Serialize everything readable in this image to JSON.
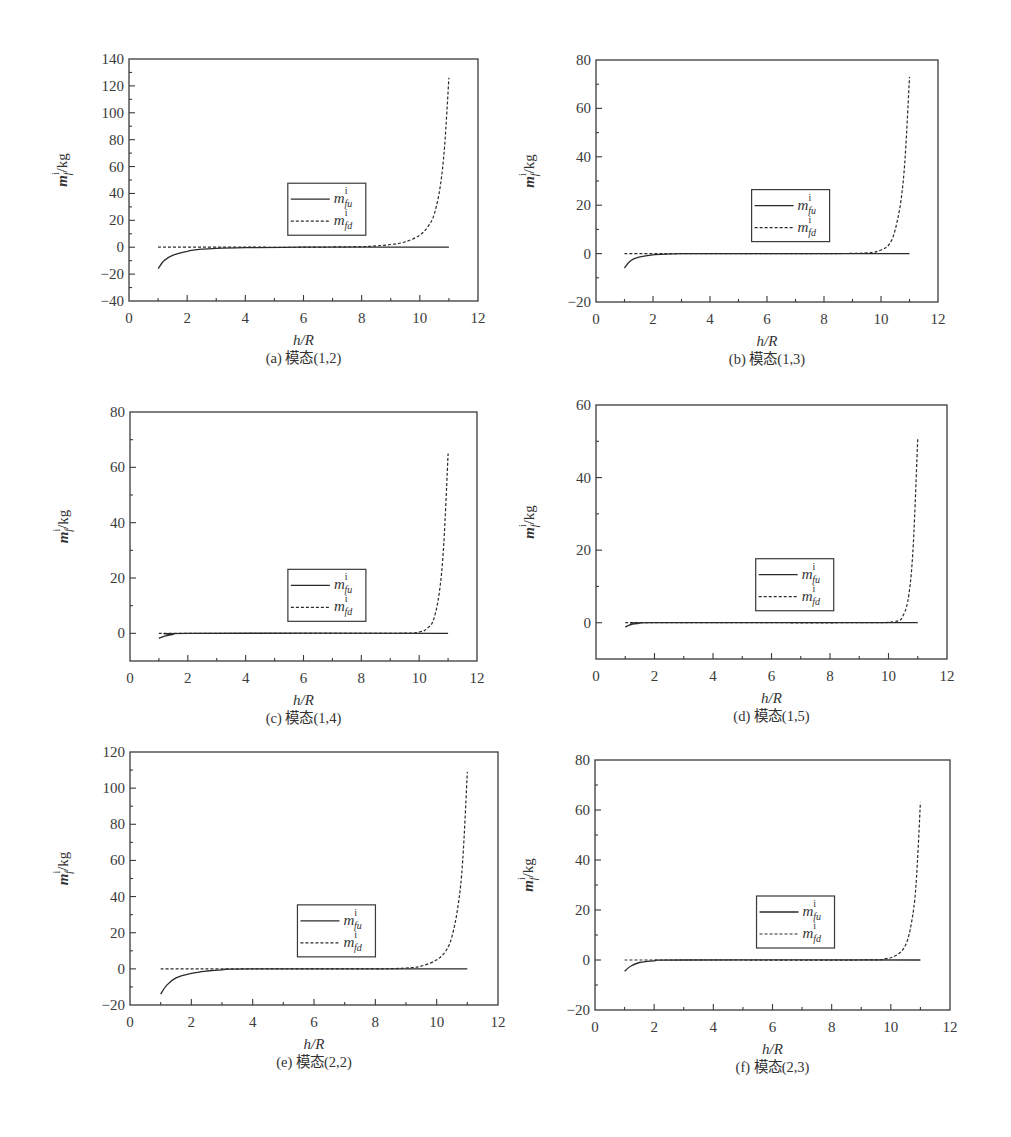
{
  "chart_data": [
    {
      "id": "a",
      "type": "line",
      "caption": "(a) 模态(1,2)",
      "xlabel": "h/R",
      "ylabel": "m_f^i/kg",
      "xlim": [
        0,
        12
      ],
      "ylim": [
        -40,
        140
      ],
      "xticks": [
        0,
        2,
        4,
        6,
        8,
        10,
        12
      ],
      "yticks": [
        -40,
        -20,
        0,
        20,
        40,
        60,
        80,
        100,
        120,
        140
      ],
      "grid": false,
      "legend": {
        "position": "center",
        "entries": [
          "m_fu^i",
          "m_fd^i"
        ]
      },
      "series": [
        {
          "name": "m_fu^i",
          "style": "solid",
          "x": [
            1,
            1.2,
            1.5,
            2,
            2.5,
            3,
            4,
            6,
            8,
            10,
            11
          ],
          "y": [
            -16,
            -10,
            -6,
            -3,
            -1.5,
            -0.8,
            -0.3,
            0,
            0,
            0,
            0
          ]
        },
        {
          "name": "m_fd^i",
          "style": "dashed",
          "x": [
            1,
            2,
            4,
            6,
            8,
            8.5,
            9,
            9.5,
            10,
            10.3,
            10.5,
            10.7,
            10.85,
            11
          ],
          "y": [
            0,
            0,
            0,
            0,
            0.5,
            1,
            2,
            4,
            9,
            16,
            25,
            45,
            75,
            126
          ]
        }
      ]
    },
    {
      "id": "b",
      "type": "line",
      "caption": "(b) 模态(1,3)",
      "xlabel": "h/R",
      "ylabel": "m_f^i/kg",
      "xlim": [
        0,
        12
      ],
      "ylim": [
        -20,
        80
      ],
      "xticks": [
        0,
        2,
        4,
        6,
        8,
        10,
        12
      ],
      "yticks": [
        -20,
        0,
        20,
        40,
        60,
        80
      ],
      "grid": false,
      "legend": {
        "position": "center",
        "entries": [
          "m_fu^i",
          "m_fd^i"
        ]
      },
      "series": [
        {
          "name": "m_fu^i",
          "style": "solid",
          "x": [
            1,
            1.2,
            1.5,
            2,
            3,
            6,
            11
          ],
          "y": [
            -6,
            -3,
            -1.5,
            -0.5,
            0,
            0,
            0
          ]
        },
        {
          "name": "m_fd^i",
          "style": "dashed",
          "x": [
            1,
            4,
            8,
            9.5,
            10,
            10.3,
            10.5,
            10.7,
            10.85,
            11
          ],
          "y": [
            0,
            0,
            0,
            0.3,
            1.5,
            4,
            10,
            22,
            40,
            73
          ]
        }
      ]
    },
    {
      "id": "c",
      "type": "line",
      "caption": "(c) 模态(1,4)",
      "xlabel": "h/R",
      "ylabel": "m_f^i/kg",
      "xlim": [
        0,
        12
      ],
      "ylim": [
        -10,
        80
      ],
      "xticks": [
        0,
        2,
        4,
        6,
        8,
        10,
        12
      ],
      "yticks": [
        0,
        20,
        40,
        60,
        80
      ],
      "grid": false,
      "legend": {
        "position": "center",
        "entries": [
          "m_fu^i",
          "m_fd^i"
        ]
      },
      "series": [
        {
          "name": "m_fu^i",
          "style": "solid",
          "x": [
            1,
            1.2,
            1.5,
            2,
            11
          ],
          "y": [
            -1.8,
            -1,
            -0.4,
            0,
            0
          ]
        },
        {
          "name": "m_fd^i",
          "style": "dashed",
          "x": [
            1,
            4,
            9,
            10,
            10.3,
            10.5,
            10.7,
            10.85,
            11
          ],
          "y": [
            0,
            0,
            0,
            0.5,
            2,
            5,
            15,
            32,
            65
          ]
        }
      ]
    },
    {
      "id": "d",
      "type": "line",
      "caption": "(d) 模态(1,5)",
      "xlabel": "h/R",
      "ylabel": "m_f^i/kg",
      "xlim": [
        0,
        12
      ],
      "ylim": [
        -10,
        60
      ],
      "xticks": [
        0,
        2,
        4,
        6,
        8,
        10,
        12
      ],
      "yticks": [
        0,
        20,
        40,
        60
      ],
      "grid": false,
      "legend": {
        "position": "center",
        "entries": [
          "m_fu^i",
          "m_fd^i"
        ]
      },
      "series": [
        {
          "name": "m_fu^i",
          "style": "solid",
          "x": [
            1,
            1.2,
            1.5,
            2,
            11
          ],
          "y": [
            -1.2,
            -0.5,
            -0.2,
            0,
            0
          ]
        },
        {
          "name": "m_fd^i",
          "style": "dashed",
          "x": [
            1,
            4,
            9,
            10.2,
            10.5,
            10.7,
            10.85,
            11
          ],
          "y": [
            0,
            0,
            0,
            0.3,
            2,
            8,
            22,
            51
          ]
        }
      ]
    },
    {
      "id": "e",
      "type": "line",
      "caption": "(e) 模态(2,2)",
      "xlabel": "h/R",
      "ylabel": "m_f^i/kg",
      "xlim": [
        0,
        12
      ],
      "ylim": [
        -20,
        120
      ],
      "xticks": [
        0,
        2,
        4,
        6,
        8,
        10,
        12
      ],
      "yticks": [
        -20,
        0,
        20,
        40,
        60,
        80,
        100,
        120
      ],
      "grid": false,
      "legend": {
        "position": "center",
        "entries": [
          "m_fu^i",
          "m_fd^i"
        ]
      },
      "series": [
        {
          "name": "m_fu^i",
          "style": "solid",
          "x": [
            1,
            1.2,
            1.5,
            2,
            2.5,
            3,
            4,
            11
          ],
          "y": [
            -14,
            -9,
            -5,
            -2.5,
            -1.2,
            -0.5,
            0,
            0
          ]
        },
        {
          "name": "m_fd^i",
          "style": "dashed",
          "x": [
            1,
            4,
            8,
            9,
            9.5,
            10,
            10.3,
            10.5,
            10.7,
            10.85,
            11
          ],
          "y": [
            0,
            0,
            0,
            0.5,
            1.5,
            5,
            10,
            18,
            35,
            60,
            109
          ]
        }
      ]
    },
    {
      "id": "f",
      "type": "line",
      "caption": "(f) 模态(2,3)",
      "xlabel": "h/R",
      "ylabel": "m_f^i/kg",
      "xlim": [
        0,
        12
      ],
      "ylim": [
        -20,
        80
      ],
      "xticks": [
        0,
        2,
        4,
        6,
        8,
        10,
        12
      ],
      "yticks": [
        -20,
        0,
        20,
        40,
        60,
        80
      ],
      "grid": false,
      "legend": {
        "position": "center",
        "entries": [
          "m_fu^i",
          "m_fd^i"
        ]
      },
      "series": [
        {
          "name": "m_fu^i",
          "style": "solid",
          "x": [
            1,
            1.2,
            1.5,
            2,
            3,
            11
          ],
          "y": [
            -4.5,
            -2.5,
            -1,
            -0.3,
            0,
            0
          ]
        },
        {
          "name": "m_fd^i",
          "style": "dashed",
          "x": [
            1,
            4,
            9,
            9.8,
            10.2,
            10.5,
            10.7,
            10.85,
            11
          ],
          "y": [
            0,
            0,
            0,
            0.5,
            2,
            6,
            15,
            30,
            63
          ]
        }
      ]
    }
  ],
  "panels_layout": [
    {
      "id": "a",
      "frame": {
        "left": 129,
        "right": 478,
        "top": 59,
        "bottom": 301
      }
    },
    {
      "id": "b",
      "frame": {
        "left": 596,
        "right": 938,
        "top": 60,
        "bottom": 302
      }
    },
    {
      "id": "c",
      "frame": {
        "left": 130,
        "right": 477,
        "top": 412,
        "bottom": 661
      }
    },
    {
      "id": "d",
      "frame": {
        "left": 596,
        "right": 947,
        "top": 405,
        "bottom": 659
      }
    },
    {
      "id": "e",
      "frame": {
        "left": 130,
        "right": 498,
        "top": 752,
        "bottom": 1005
      }
    },
    {
      "id": "f",
      "frame": {
        "left": 595,
        "right": 950,
        "top": 760,
        "bottom": 1010
      }
    }
  ],
  "legend_labels": {
    "base": "m",
    "sup": "i",
    "sub_u": "fu",
    "sub_d": "fd"
  },
  "axis_labels": {
    "x_main": "h",
    "x_rest": "/R",
    "y_main": "m",
    "y_sup": "i",
    "y_sub": "f",
    "y_unit": "/kg"
  }
}
